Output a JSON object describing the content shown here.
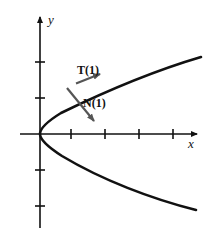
{
  "figure": {
    "type": "math-diagram",
    "background_color": "#ffffff",
    "curve_color": "#111111",
    "axis_color": "#111111",
    "vector_color": "#555555"
  },
  "axes": {
    "x_label": "x",
    "y_label": "y",
    "origin": {
      "x": 40,
      "y": 134
    },
    "x_axis": {
      "start_x": 20,
      "end_x": 200,
      "y": 134,
      "arrow": "right"
    },
    "y_axis": {
      "x": 40,
      "start_y": 228,
      "end_y": 14,
      "arrow": "up"
    },
    "x_ticks": [
      71,
      105,
      139,
      173
    ],
    "y_ticks": [
      62,
      98,
      170,
      206
    ],
    "tick_length": 10,
    "grid": false
  },
  "curve": {
    "name": "parabola",
    "opens": "right",
    "vertex": {
      "x": 40,
      "y": 134
    },
    "upper_branch_end": {
      "x": 201,
      "y": 57
    },
    "lower_branch_end": {
      "x": 196,
      "y": 210
    },
    "stroke_width": 2.6
  },
  "vectors": [
    {
      "name": "tangent",
      "label": "T(1)",
      "label_x": 77,
      "label_y": 74,
      "tail": {
        "x": 76,
        "y": 82
      },
      "tip": {
        "x": 101,
        "y": 73
      },
      "direction": "up-right, along curve"
    },
    {
      "name": "normal",
      "label": "N(1)",
      "label_x": 83,
      "label_y": 106,
      "tail": {
        "x": 68,
        "y": 88
      },
      "tip": {
        "x": 96,
        "y": 123
      },
      "direction": "down-right, perpendicular to curve"
    }
  ]
}
